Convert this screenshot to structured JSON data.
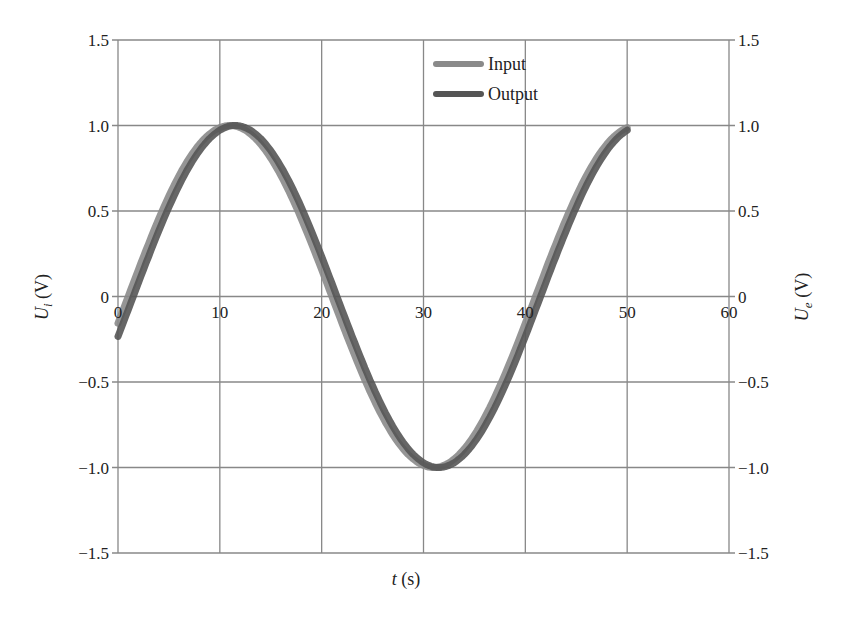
{
  "chart_data": {
    "type": "line",
    "title": "",
    "xlabel": "t (s)",
    "ylabel": "U_i (V)",
    "ylabel_right": "U_e (V)",
    "xlim": [
      0,
      60
    ],
    "ylim": [
      -1.5,
      1.5
    ],
    "xticks": [
      "0",
      "10",
      "20",
      "30",
      "40",
      "50",
      "60"
    ],
    "yticks": [
      "1.5",
      "1.0",
      "0.5",
      "0",
      "-0.5",
      "-1.0",
      "-1.5"
    ],
    "grid": true,
    "legend_position": "top-center",
    "series": [
      {
        "name": "Input",
        "color": "#8a8a8a",
        "x": [
          0,
          5,
          10,
          11,
          15,
          20,
          21,
          25,
          30,
          31,
          35,
          40,
          41,
          45,
          50
        ],
        "y": [
          -0.16,
          0.58,
          0.99,
          1.0,
          0.81,
          0.16,
          0.0,
          -0.59,
          -0.99,
          -1.0,
          -0.81,
          -0.16,
          0.0,
          0.59,
          0.99
        ]
      },
      {
        "name": "Output",
        "color": "#555555",
        "x": [
          0,
          5,
          10,
          11.5,
          15,
          20,
          21.5,
          25,
          30,
          31.5,
          35,
          40,
          41.5,
          45,
          50
        ],
        "y": [
          -0.23,
          0.52,
          0.98,
          1.0,
          0.85,
          0.23,
          0.0,
          -0.52,
          -0.98,
          -1.0,
          -0.85,
          -0.23,
          0.0,
          0.52,
          0.98
        ]
      }
    ]
  },
  "legend": {
    "input": "Input",
    "output": "Output"
  },
  "axes": {
    "xlabel_var": "t",
    "xlabel_unit": " (s)",
    "ylabel_var": "U",
    "ylabel_sub": "i",
    "ylabel_unit": " (V)",
    "ylabel_right_sub": "e"
  }
}
